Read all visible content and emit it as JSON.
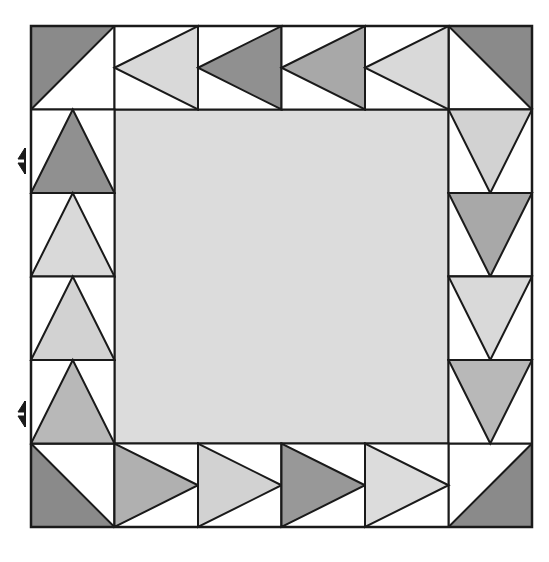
{
  "figure": {
    "caption": "",
    "background_color": "#ffffff",
    "line_color": "#1a1a1a",
    "line_width": 2
  },
  "palette": {
    "white": "#ffffff",
    "light": "#d9d9d9",
    "light_alt": "#d2d2d2",
    "center_light": "#dcdcdc",
    "medium": "#b8b8b8",
    "medium_dark": "#a8a8a8",
    "dark": "#909090",
    "darkest": "#8a8a8a",
    "outline": "#1a1a1a"
  },
  "block": {
    "name": "flying-geese-border-block",
    "origin_x": 31,
    "origin_y": 26,
    "size": 501,
    "grid_divisions": 6,
    "cell_size": 83.5
  },
  "corners": [
    {
      "name": "corner-top-left",
      "col": 0,
      "row": 0,
      "fill": "#8a8a8a",
      "triangle_corner": "top-left",
      "label": "Top left corner half-square triangle, dark"
    },
    {
      "name": "corner-top-right",
      "col": 5,
      "row": 0,
      "fill": "#8a8a8a",
      "triangle_corner": "top-right",
      "label": "Top right corner half-square triangle, dark"
    },
    {
      "name": "corner-bottom-left",
      "col": 0,
      "row": 5,
      "fill": "#8a8a8a",
      "triangle_corner": "bottom-left",
      "label": "Bottom left corner half-square triangle, dark"
    },
    {
      "name": "corner-bottom-right",
      "col": 5,
      "row": 5,
      "fill": "#8a8a8a",
      "triangle_corner": "bottom-right",
      "label": "Bottom right corner half-square triangle, dark"
    }
  ],
  "geese": {
    "top_row": {
      "name": "top-geese-row",
      "direction": "left",
      "count": 4,
      "units": [
        {
          "name": "top-goose-1",
          "index": 1,
          "fill": "#d9d9d9",
          "shade": "light"
        },
        {
          "name": "top-goose-2",
          "index": 2,
          "fill": "#909090",
          "shade": "dark"
        },
        {
          "name": "top-goose-3",
          "index": 3,
          "fill": "#a8a8a8",
          "shade": "medium-dark"
        },
        {
          "name": "top-goose-4",
          "index": 4,
          "fill": "#d9d9d9",
          "shade": "light"
        }
      ]
    },
    "left_column": {
      "name": "left-geese-column",
      "direction": "up",
      "count": 4,
      "units": [
        {
          "name": "left-goose-1",
          "index": 1,
          "fill": "#909090",
          "shade": "dark"
        },
        {
          "name": "left-goose-2",
          "index": 2,
          "fill": "#d9d9d9",
          "shade": "light"
        },
        {
          "name": "left-goose-3",
          "index": 3,
          "fill": "#d2d2d2",
          "shade": "light"
        },
        {
          "name": "left-goose-4",
          "index": 4,
          "fill": "#b8b8b8",
          "shade": "medium"
        }
      ]
    },
    "right_column": {
      "name": "right-geese-column",
      "direction": "down",
      "count": 4,
      "units": [
        {
          "name": "right-goose-1",
          "index": 1,
          "fill": "#d2d2d2",
          "shade": "light"
        },
        {
          "name": "right-goose-2",
          "index": 2,
          "fill": "#a8a8a8",
          "shade": "medium-dark"
        },
        {
          "name": "right-goose-3",
          "index": 3,
          "fill": "#d9d9d9",
          "shade": "light"
        },
        {
          "name": "right-goose-4",
          "index": 4,
          "fill": "#b8b8b8",
          "shade": "medium"
        }
      ]
    },
    "bottom_row": {
      "name": "bottom-geese-row",
      "direction": "right",
      "count": 4,
      "units": [
        {
          "name": "bottom-goose-1",
          "index": 1,
          "fill": "#b0b0b0",
          "shade": "medium"
        },
        {
          "name": "bottom-goose-2",
          "index": 2,
          "fill": "#d2d2d2",
          "shade": "light"
        },
        {
          "name": "bottom-goose-3",
          "index": 3,
          "fill": "#989898",
          "shade": "dark"
        },
        {
          "name": "bottom-goose-4",
          "index": 4,
          "fill": "#dcdcdc",
          "shade": "light"
        }
      ]
    }
  },
  "center": {
    "name": "center-square",
    "fill": "#dcdcdc",
    "col_span": 4,
    "row_span": 4,
    "label": "Center plain square, light"
  },
  "markers": [
    {
      "name": "seam-marker-upper",
      "type": "bowtie-arrow",
      "x": 17,
      "y": 161,
      "label": "Seam alignment marker, upper"
    },
    {
      "name": "seam-marker-lower",
      "type": "bowtie-arrow",
      "x": 17,
      "y": 414,
      "label": "Seam alignment marker, lower"
    }
  ]
}
